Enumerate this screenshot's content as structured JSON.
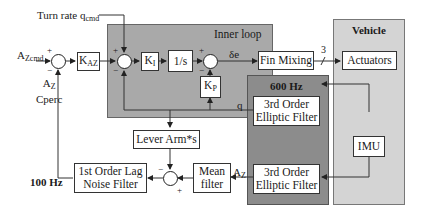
{
  "diagram": {
    "type": "control-loop block diagram",
    "regions": {
      "inner_loop": {
        "title": "Inner loop",
        "color": "#a9a9a9"
      },
      "filter_600": {
        "title": "600 Hz",
        "color": "#8c8c8c"
      },
      "vehicle": {
        "title": "Vehicle",
        "color": "#d4d4d4"
      },
      "rate_100": {
        "title": "100 Hz"
      }
    },
    "inputs": {
      "turn_rate": {
        "main": "Turn rate q",
        "sub": "cmd"
      },
      "az_cmd": {
        "main": "A",
        "sub": "Zcmd"
      },
      "az_cperc": {
        "line1_main": "A",
        "line1_sub": "Z",
        "line2": "Cperc"
      }
    },
    "blocks": {
      "kaz": {
        "main": "K",
        "sub": "AZ"
      },
      "ki": {
        "main": "K",
        "sub": "I"
      },
      "integrator": {
        "label": "1/s"
      },
      "kp": {
        "main": "K",
        "sub": "P"
      },
      "fin_mixing": {
        "label": "Fin Mixing"
      },
      "actuators": {
        "label": "Actuators"
      },
      "elliptic_top": {
        "line1": "3rd Order",
        "line2": "Elliptic Filter"
      },
      "elliptic_bottom": {
        "line1": "3rd Order",
        "line2": "Elliptic Filter"
      },
      "imu": {
        "label": "IMU"
      },
      "lever_arm": {
        "label": "Lever Arm*s"
      },
      "mean_filter": {
        "line1": "Mean",
        "line2": "filter"
      },
      "lag_filter": {
        "line1": "1st Order Lag",
        "line2": "Noise Filter"
      }
    },
    "signals": {
      "delta_e": "δe",
      "bus_width": "3",
      "q": "q",
      "az": {
        "main": "A",
        "sub": "Z"
      }
    },
    "signs": {
      "plus": "+",
      "minus": "−"
    }
  }
}
